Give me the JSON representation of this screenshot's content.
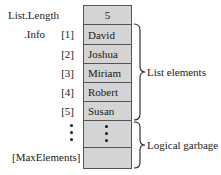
{
  "labels": {
    "length": "List.Length",
    "info": ".Info",
    "max": "[MaxElements]"
  },
  "length_value": "5",
  "elements": [
    {
      "index": "[1]",
      "value": "David"
    },
    {
      "index": "[2]",
      "value": "Joshua"
    },
    {
      "index": "[3]",
      "value": "Miriam"
    },
    {
      "index": "[4]",
      "value": "Robert"
    },
    {
      "index": "[5]",
      "value": "Susan"
    }
  ],
  "braces": {
    "list_elements": "List elements",
    "logical_garbage": "Logical garbage"
  },
  "colors": {
    "cell_fill": "#d4d4d4",
    "border": "#555555"
  }
}
